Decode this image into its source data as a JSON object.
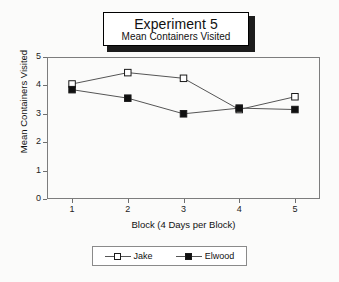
{
  "chart_data": {
    "type": "line",
    "title": "Experiment 5",
    "subtitle": "Mean Containers Visited",
    "xlabel": "Block (4 Days per Block)",
    "ylabel": "Mean Containers Visited",
    "x": [
      1,
      2,
      3,
      4,
      5
    ],
    "xticklabels": [
      "1",
      "2",
      "3",
      "4",
      "5"
    ],
    "yticklabels": [
      "0",
      "1",
      "2",
      "3",
      "4",
      "5"
    ],
    "xlim": [
      0.55,
      5.45
    ],
    "ylim": [
      0,
      5
    ],
    "grid": false,
    "legend_position": "below-axes",
    "series": [
      {
        "name": "Jake",
        "marker": "open-square",
        "values": [
          4.05,
          4.45,
          4.25,
          3.15,
          3.6
        ]
      },
      {
        "name": "Elwood",
        "marker": "filled-square",
        "values": [
          3.85,
          3.55,
          3.0,
          3.2,
          3.15
        ]
      }
    ]
  },
  "legend": {
    "entries": [
      {
        "label": "Jake"
      },
      {
        "label": "Elwood"
      }
    ]
  },
  "colors": {
    "line": "#555555",
    "marker_edge": "#1a1a1a",
    "marker_open_fill": "#ffffff",
    "marker_filled_fill": "#101010",
    "axis": "#7d7d7d",
    "background": "#fbfbfa",
    "title_border": "#000000",
    "title_shadow": "#1c1c1c"
  }
}
